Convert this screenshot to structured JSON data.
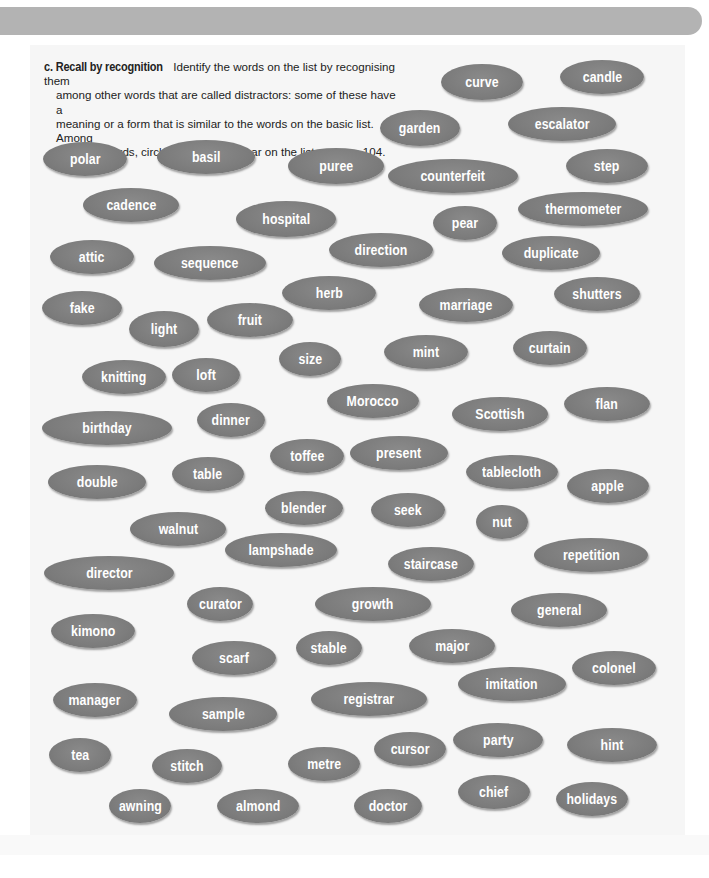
{
  "exercise": {
    "label": "c. Recall by recognition",
    "instructions": "Identify the words on the list by recognising them among other words that are called distractors: some of these have a meaning or a form that is similar to the words on the basic list. Among these 70 words, circle those that appear on the list on page 104.",
    "lines": [
      "Identify the words on the list by recognising them",
      "among other words that are called distractors: some of these have a",
      "meaning or a form that is similar to the words on the basic list. Among",
      "these 70 words, circle those that appear on the list on page 104."
    ],
    "word_count": 70,
    "page_reference": 104
  },
  "colors": {
    "header_bar": "#b3b3b3",
    "panel_background": "#f6f6f6",
    "oval_fill": "#7c7c7c",
    "oval_text": "#ffffff"
  },
  "words": [
    {
      "text": "curve",
      "x": 482,
      "y": 82,
      "w": 82,
      "h": 36
    },
    {
      "text": "candle",
      "x": 602,
      "y": 77,
      "w": 84,
      "h": 34
    },
    {
      "text": "garden",
      "x": 420,
      "y": 128,
      "w": 80,
      "h": 36
    },
    {
      "text": "escalator",
      "x": 562,
      "y": 124,
      "w": 108,
      "h": 34
    },
    {
      "text": "polar",
      "x": 85,
      "y": 159,
      "w": 84,
      "h": 34
    },
    {
      "text": "basil",
      "x": 206,
      "y": 157,
      "w": 98,
      "h": 34
    },
    {
      "text": "puree",
      "x": 336,
      "y": 166,
      "w": 96,
      "h": 36
    },
    {
      "text": "counterfeit",
      "x": 453,
      "y": 176,
      "w": 130,
      "h": 34
    },
    {
      "text": "step",
      "x": 607,
      "y": 166,
      "w": 82,
      "h": 34
    },
    {
      "text": "cadence",
      "x": 131,
      "y": 205,
      "w": 96,
      "h": 34
    },
    {
      "text": "hospital",
      "x": 286,
      "y": 219,
      "w": 100,
      "h": 36
    },
    {
      "text": "pear",
      "x": 465,
      "y": 223,
      "w": 64,
      "h": 34
    },
    {
      "text": "thermometer",
      "x": 583,
      "y": 209,
      "w": 130,
      "h": 34
    },
    {
      "text": "attic",
      "x": 92,
      "y": 257,
      "w": 84,
      "h": 34
    },
    {
      "text": "sequence",
      "x": 210,
      "y": 263,
      "w": 112,
      "h": 34
    },
    {
      "text": "direction",
      "x": 381,
      "y": 250,
      "w": 104,
      "h": 34
    },
    {
      "text": "duplicate",
      "x": 551,
      "y": 253,
      "w": 98,
      "h": 34
    },
    {
      "text": "fake",
      "x": 82,
      "y": 308,
      "w": 80,
      "h": 34
    },
    {
      "text": "light",
      "x": 164,
      "y": 329,
      "w": 70,
      "h": 36
    },
    {
      "text": "fruit",
      "x": 250,
      "y": 320,
      "w": 86,
      "h": 34
    },
    {
      "text": "herb",
      "x": 329,
      "y": 293,
      "w": 94,
      "h": 34
    },
    {
      "text": "marriage",
      "x": 466,
      "y": 305,
      "w": 94,
      "h": 34
    },
    {
      "text": "shutters",
      "x": 597,
      "y": 294,
      "w": 86,
      "h": 34
    },
    {
      "text": "size",
      "x": 310,
      "y": 359,
      "w": 62,
      "h": 34
    },
    {
      "text": "mint",
      "x": 426,
      "y": 352,
      "w": 84,
      "h": 34
    },
    {
      "text": "curtain",
      "x": 550,
      "y": 348,
      "w": 74,
      "h": 34
    },
    {
      "text": "knitting",
      "x": 124,
      "y": 377,
      "w": 84,
      "h": 34
    },
    {
      "text": "loft",
      "x": 206,
      "y": 375,
      "w": 68,
      "h": 34
    },
    {
      "text": "Morocco",
      "x": 373,
      "y": 401,
      "w": 92,
      "h": 34
    },
    {
      "text": "birthday",
      "x": 107,
      "y": 428,
      "w": 130,
      "h": 34
    },
    {
      "text": "dinner",
      "x": 231,
      "y": 420,
      "w": 68,
      "h": 34
    },
    {
      "text": "Scottish",
      "x": 500,
      "y": 414,
      "w": 96,
      "h": 34
    },
    {
      "text": "flan",
      "x": 607,
      "y": 404,
      "w": 86,
      "h": 34
    },
    {
      "text": "toffee",
      "x": 307,
      "y": 456,
      "w": 74,
      "h": 34
    },
    {
      "text": "present",
      "x": 399,
      "y": 453,
      "w": 98,
      "h": 34
    },
    {
      "text": "double",
      "x": 97,
      "y": 482,
      "w": 98,
      "h": 34
    },
    {
      "text": "table",
      "x": 208,
      "y": 474,
      "w": 72,
      "h": 34
    },
    {
      "text": "tablecloth",
      "x": 512,
      "y": 472,
      "w": 92,
      "h": 34
    },
    {
      "text": "apple",
      "x": 608,
      "y": 486,
      "w": 82,
      "h": 34
    },
    {
      "text": "blender",
      "x": 304,
      "y": 508,
      "w": 78,
      "h": 34
    },
    {
      "text": "seek",
      "x": 408,
      "y": 510,
      "w": 74,
      "h": 34
    },
    {
      "text": "nut",
      "x": 502,
      "y": 522,
      "w": 52,
      "h": 34
    },
    {
      "text": "walnut",
      "x": 178,
      "y": 529,
      "w": 96,
      "h": 34
    },
    {
      "text": "lampshade",
      "x": 281,
      "y": 550,
      "w": 112,
      "h": 34
    },
    {
      "text": "staircase",
      "x": 431,
      "y": 564,
      "w": 86,
      "h": 34
    },
    {
      "text": "repetition",
      "x": 591,
      "y": 555,
      "w": 114,
      "h": 34
    },
    {
      "text": "director",
      "x": 109,
      "y": 573,
      "w": 130,
      "h": 34
    },
    {
      "text": "curator",
      "x": 220,
      "y": 604,
      "w": 66,
      "h": 34
    },
    {
      "text": "growth",
      "x": 373,
      "y": 604,
      "w": 116,
      "h": 34
    },
    {
      "text": "general",
      "x": 559,
      "y": 610,
      "w": 96,
      "h": 34
    },
    {
      "text": "kimono",
      "x": 93,
      "y": 631,
      "w": 84,
      "h": 34
    },
    {
      "text": "stable",
      "x": 329,
      "y": 648,
      "w": 66,
      "h": 34
    },
    {
      "text": "major",
      "x": 452,
      "y": 646,
      "w": 86,
      "h": 34
    },
    {
      "text": "scarf",
      "x": 234,
      "y": 658,
      "w": 84,
      "h": 34
    },
    {
      "text": "colonel",
      "x": 614,
      "y": 668,
      "w": 84,
      "h": 34
    },
    {
      "text": "imitation",
      "x": 512,
      "y": 684,
      "w": 108,
      "h": 34
    },
    {
      "text": "manager",
      "x": 95,
      "y": 700,
      "w": 84,
      "h": 34
    },
    {
      "text": "registrar",
      "x": 369,
      "y": 699,
      "w": 116,
      "h": 34
    },
    {
      "text": "sample",
      "x": 223,
      "y": 714,
      "w": 108,
      "h": 34
    },
    {
      "text": "tea",
      "x": 80,
      "y": 755,
      "w": 62,
      "h": 34
    },
    {
      "text": "stitch",
      "x": 187,
      "y": 766,
      "w": 70,
      "h": 34
    },
    {
      "text": "metre",
      "x": 324,
      "y": 764,
      "w": 72,
      "h": 34
    },
    {
      "text": "cursor",
      "x": 410,
      "y": 749,
      "w": 72,
      "h": 34
    },
    {
      "text": "party",
      "x": 498,
      "y": 740,
      "w": 90,
      "h": 34
    },
    {
      "text": "hint",
      "x": 612,
      "y": 745,
      "w": 90,
      "h": 34
    },
    {
      "text": "awning",
      "x": 140,
      "y": 806,
      "w": 62,
      "h": 34
    },
    {
      "text": "almond",
      "x": 258,
      "y": 806,
      "w": 82,
      "h": 34
    },
    {
      "text": "doctor",
      "x": 388,
      "y": 806,
      "w": 68,
      "h": 34
    },
    {
      "text": "chief",
      "x": 494,
      "y": 792,
      "w": 72,
      "h": 34
    },
    {
      "text": "holidays",
      "x": 592,
      "y": 799,
      "w": 72,
      "h": 34
    }
  ]
}
